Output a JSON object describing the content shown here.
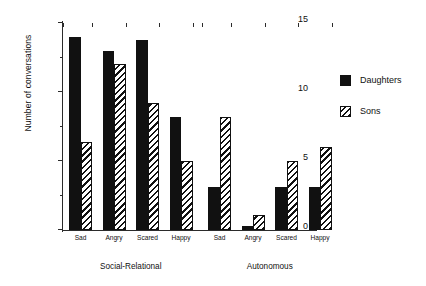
{
  "chart_data": {
    "type": "bar",
    "title": "",
    "xlabel": "",
    "ylabel": "Number of conversations",
    "ylim": [
      0,
      15
    ],
    "yticks": [
      0,
      5,
      10,
      15
    ],
    "ytick_labels": [
      "0",
      "5",
      "10",
      "15"
    ],
    "yminor_ticks": [
      2.5,
      7.5,
      12.5
    ],
    "grid": false,
    "legend_position": "right",
    "groups": [
      {
        "name": "Social-Relational",
        "categories": [
          "Sad",
          "Angry",
          "Scared",
          "Happy"
        ],
        "series": [
          {
            "name": "Daughters",
            "values": [
              14.0,
              13.0,
              13.8,
              8.2
            ]
          },
          {
            "name": "Sons",
            "values": [
              6.4,
              12.0,
              9.2,
              5.0
            ]
          }
        ]
      },
      {
        "name": "Autonomous",
        "categories": [
          "Sad",
          "Angry",
          "Scared",
          "Happy"
        ],
        "series": [
          {
            "name": "Daughters",
            "values": [
              3.1,
              0.3,
              3.1,
              3.1
            ]
          },
          {
            "name": "Sons",
            "values": [
              8.2,
              1.1,
              5.0,
              6.0
            ]
          }
        ]
      }
    ],
    "categories": [
      "Sad",
      "Angry",
      "Scared",
      "Happy",
      "Sad",
      "Angry",
      "Scared",
      "Happy"
    ],
    "series": [
      {
        "name": "Daughters",
        "values": [
          14.0,
          13.0,
          13.8,
          8.2,
          3.1,
          0.3,
          3.1,
          3.1
        ]
      },
      {
        "name": "Sons",
        "values": [
          6.4,
          12.0,
          9.2,
          5.0,
          8.2,
          1.1,
          5.0,
          6.0
        ]
      }
    ]
  },
  "legend": {
    "items": [
      {
        "label": "Daughters",
        "pattern": "solid-black",
        "color": "#111111"
      },
      {
        "label": "Sons",
        "pattern": "diagonal-hatch",
        "color": "#111111"
      }
    ]
  },
  "axes": {
    "y_title": "Number of conversations",
    "y_labels": [
      "15",
      "10",
      "5",
      "0"
    ]
  }
}
